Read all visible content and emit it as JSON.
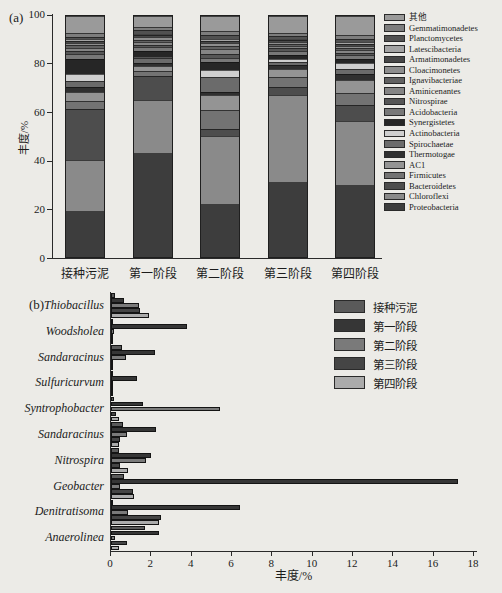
{
  "page_background": "#ecebe7",
  "chart_data": [
    {
      "type": "bar",
      "subtype": "stacked-vertical",
      "panel": "(a)",
      "title": "",
      "xlabel": "",
      "ylabel": "丰度/%",
      "ylim": [
        0,
        100
      ],
      "yticks": [
        0,
        20,
        40,
        60,
        80,
        100
      ],
      "grid": false,
      "legend_position": "right",
      "categories": [
        "接种污泥",
        "第一阶段",
        "第二阶段",
        "第三阶段",
        "第四阶段"
      ],
      "series": [
        {
          "name": "其他",
          "color": "#9a9a9a",
          "values": [
            7.2,
            4.5,
            6.5,
            7.0,
            8.0
          ]
        },
        {
          "name": "Gemmatimonadetes",
          "color": "#7d7d7d",
          "values": [
            1.6,
            1.5,
            1.5,
            1.3,
            1.7
          ]
        },
        {
          "name": "Planctomycetes",
          "color": "#515151",
          "values": [
            1.0,
            1.5,
            1.5,
            1.2,
            1.2
          ]
        },
        {
          "name": "Latescibacteria",
          "color": "#a3a3a3",
          "values": [
            0.7,
            0.5,
            0.8,
            0.6,
            0.7
          ]
        },
        {
          "name": "Armatimonadetes",
          "color": "#474747",
          "values": [
            0.8,
            1.0,
            1.0,
            0.7,
            0.8
          ]
        },
        {
          "name": "Cloacimonetes",
          "color": "#8e8e8e",
          "values": [
            1.0,
            1.0,
            1.2,
            0.8,
            0.9
          ]
        },
        {
          "name": "Ignavibacteriae",
          "color": "#616161",
          "values": [
            1.0,
            1.0,
            1.2,
            1.0,
            1.0
          ]
        },
        {
          "name": "Aminicenantes",
          "color": "#858585",
          "values": [
            1.2,
            1.0,
            2.3,
            1.0,
            1.0
          ]
        },
        {
          "name": "Nitrospirae",
          "color": "#565656",
          "values": [
            1.3,
            1.0,
            1.7,
            1.0,
            1.2
          ]
        },
        {
          "name": "Acidobacteria",
          "color": "#787878",
          "values": [
            2.2,
            1.5,
            1.5,
            1.7,
            1.5
          ]
        },
        {
          "name": "Synergistetes",
          "color": "#262626",
          "values": [
            6.3,
            2.5,
            3.5,
            1.5,
            1.6
          ]
        },
        {
          "name": "Actinobacteria",
          "color": "#cfcfcf",
          "values": [
            2.7,
            0.5,
            2.7,
            1.5,
            2.4
          ]
        },
        {
          "name": "Spirochaetae",
          "color": "#6b6b6b",
          "values": [
            2.5,
            2.0,
            6.3,
            1.3,
            2.0
          ]
        },
        {
          "name": "Thermotogae",
          "color": "#303030",
          "values": [
            2.0,
            1.5,
            1.2,
            1.4,
            2.7
          ]
        },
        {
          "name": "AC1",
          "color": "#949494",
          "values": [
            3.8,
            2.0,
            6.1,
            3.5,
            5.5
          ]
        },
        {
          "name": "Firmicutes",
          "color": "#737373",
          "values": [
            3.2,
            2.0,
            8.0,
            4.0,
            4.8
          ]
        },
        {
          "name": "Bacteroidetes",
          "color": "#4d4d4d",
          "values": [
            21.5,
            10.0,
            3.0,
            3.5,
            6.5
          ]
        },
        {
          "name": "Chloroflexi",
          "color": "#8a8a8a",
          "values": [
            21.0,
            22.0,
            28.0,
            36.0,
            26.5
          ]
        },
        {
          "name": "Proteobacteria",
          "color": "#3d3d3d",
          "values": [
            19.0,
            43.0,
            22.0,
            31.0,
            30.0
          ]
        }
      ]
    },
    {
      "type": "bar",
      "subtype": "grouped-horizontal",
      "panel": "(b)",
      "title": "",
      "xlabel": "丰度/%",
      "ylabel": "",
      "xlim": [
        0,
        18
      ],
      "xticks": [
        0,
        2,
        4,
        6,
        8,
        10,
        12,
        14,
        16,
        18
      ],
      "grid": false,
      "legend_position": "upper-right-inside",
      "categories": [
        "Thiobacillus",
        "Woodsholea",
        "Sandaracinus",
        "Sulfuricurvum",
        "Syntrophobacter",
        "Sandaracinus",
        "Nitrospira",
        "Geobacter",
        "Denitratisoma",
        "Anaerolinea"
      ],
      "series": [
        {
          "name": "接种污泥",
          "color": "#5a5a5a",
          "values": [
            0.2,
            0.1,
            0.55,
            0.1,
            0.15,
            0.6,
            0.4,
            0.65,
            0.1,
            1.7
          ]
        },
        {
          "name": "第一阶段",
          "color": "#363636",
          "values": [
            0.65,
            3.75,
            2.2,
            1.3,
            1.6,
            2.25,
            2.0,
            17.2,
            6.4,
            2.4
          ]
        },
        {
          "name": "第二阶段",
          "color": "#7a7a7a",
          "values": [
            1.4,
            0.15,
            0.75,
            0.05,
            5.4,
            0.8,
            1.75,
            0.45,
            0.85,
            0.2
          ]
        },
        {
          "name": "第三阶段",
          "color": "#454545",
          "values": [
            1.45,
            0.1,
            0.05,
            0.05,
            0.25,
            0.45,
            0.45,
            1.1,
            2.5,
            0.8
          ]
        },
        {
          "name": "第四阶段",
          "color": "#ababab",
          "values": [
            1.9,
            0.05,
            0.05,
            0.05,
            0.4,
            0.4,
            0.85,
            1.15,
            2.4,
            0.4
          ]
        }
      ]
    }
  ]
}
